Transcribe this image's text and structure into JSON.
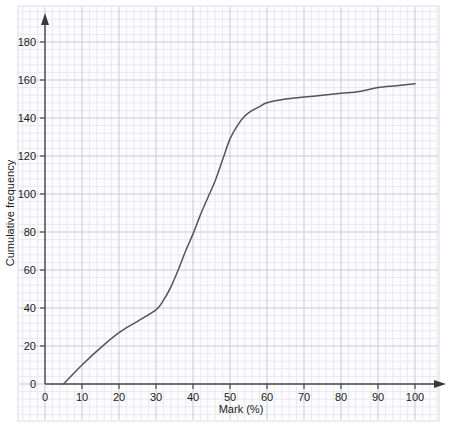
{
  "chart_data": {
    "type": "line",
    "title": "",
    "subtitle": "",
    "xlabel": "Mark (%)",
    "ylabel": "Cumulative frequency",
    "xlim": [
      0,
      105
    ],
    "ylim": [
      0,
      190
    ],
    "xticks": [
      0,
      10,
      20,
      30,
      40,
      50,
      60,
      70,
      80,
      90,
      100
    ],
    "yticks": [
      0,
      20,
      40,
      60,
      80,
      100,
      120,
      140,
      160,
      180
    ],
    "xtick_labels": [
      "0",
      "10",
      "20",
      "30",
      "40",
      "50",
      "60",
      "70",
      "80",
      "90",
      "100"
    ],
    "ytick_labels": [
      "0",
      "20",
      "40",
      "60",
      "80",
      "100",
      "120",
      "140",
      "160",
      "180"
    ],
    "grid": true,
    "grid_major_step_x": 10,
    "grid_minor_step_x": 2,
    "grid_major_step_y": 20,
    "grid_minor_step_y": 4,
    "legend": null,
    "legend_position": "none",
    "annotations": [],
    "series": [
      {
        "name": "Cumulative frequency",
        "color": "#555555",
        "x": [
          5,
          10,
          15,
          20,
          25,
          30,
          32,
          34,
          36,
          38,
          40,
          42,
          44,
          46,
          48,
          50,
          52,
          54,
          56,
          58,
          60,
          65,
          70,
          75,
          80,
          85,
          90,
          95,
          100
        ],
        "values": [
          0,
          10,
          19,
          27,
          33,
          39,
          44,
          51,
          60,
          70,
          79,
          89,
          98,
          107,
          118,
          129,
          136,
          141,
          144,
          146,
          148,
          150,
          151,
          152,
          153,
          154,
          156,
          157,
          158
        ]
      }
    ]
  },
  "axes": {
    "x_arrow": "arrow-right",
    "y_arrow": "arrow-up"
  },
  "colors": {
    "grid_minor": "#e9e9ee",
    "grid_major": "#c9c9d2",
    "axis": "#4a4a4a",
    "curve": "#555555",
    "text": "#1a1a1a",
    "paper": "#fdfdff"
  }
}
